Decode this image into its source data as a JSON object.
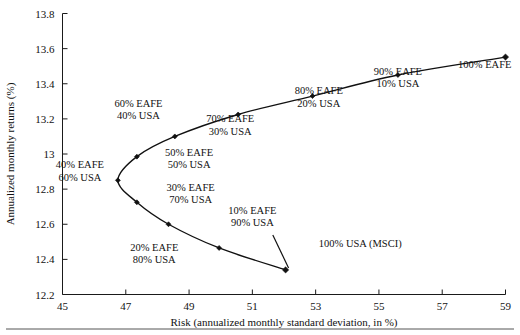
{
  "chart_data": {
    "type": "scatter",
    "title": "",
    "xlabel": "Risk (annualized monthly standard deviation, in %)",
    "ylabel": "Annualized monthly returns (%)",
    "xlim": [
      45,
      59
    ],
    "ylim": [
      12.2,
      13.8
    ],
    "xticks": [
      "45",
      "47",
      "49",
      "51",
      "53",
      "55",
      "57",
      "59"
    ],
    "xtick_values": [
      45,
      47,
      49,
      51,
      53,
      55,
      57,
      59
    ],
    "yticks": [
      "12.2",
      "12.4",
      "12.6",
      "12.8",
      "13",
      "13.2",
      "13.4",
      "13.6",
      "13.8"
    ],
    "ytick_values": [
      12.2,
      12.4,
      12.6,
      12.8,
      13.0,
      13.2,
      13.4,
      13.6,
      13.8
    ],
    "grid": false,
    "legend": "none",
    "series": [
      {
        "name": "Efficient frontier (EAFE / USA allocations)",
        "points": [
          {
            "label_line1": "100% USA (MSCI)",
            "label_line2": "",
            "x": 52.05,
            "y": 12.34,
            "label_x": 53.1,
            "label_y": 12.47,
            "leader": true
          },
          {
            "label_line1": "10% EAFE",
            "label_line2": "90% USA",
            "x": 49.95,
            "y": 12.465,
            "label_x": 51.0,
            "label_y": 12.66,
            "leader": false
          },
          {
            "label_line1": "20% EAFE",
            "label_line2": "80% USA",
            "x": 48.35,
            "y": 12.6,
            "label_x": 47.9,
            "label_y": 12.45,
            "leader": false
          },
          {
            "label_line1": "30% EAFE",
            "label_line2": "70% USA",
            "x": 47.35,
            "y": 12.725,
            "label_x": 49.05,
            "label_y": 12.79,
            "leader": false
          },
          {
            "label_line1": "40% EAFE",
            "label_line2": "60% USA",
            "x": 46.75,
            "y": 12.85,
            "label_x": 45.55,
            "label_y": 12.92,
            "leader": false
          },
          {
            "label_line1": "50% EAFE",
            "label_line2": "50% USA",
            "x": 47.35,
            "y": 12.985,
            "label_x": 49.0,
            "label_y": 12.99,
            "leader": false
          },
          {
            "label_line1": "60% EAFE",
            "label_line2": "40% USA",
            "x": 48.55,
            "y": 13.1,
            "label_x": 47.4,
            "label_y": 13.27,
            "leader": false
          },
          {
            "label_line1": "70% EAFE",
            "label_line2": "30% USA",
            "x": 50.55,
            "y": 13.225,
            "label_x": 50.3,
            "label_y": 13.18,
            "leader": false
          },
          {
            "label_line1": "80% EAFE",
            "label_line2": "20% USA",
            "x": 52.9,
            "y": 13.33,
            "label_x": 53.1,
            "label_y": 13.34,
            "leader": false
          },
          {
            "label_line1": "90% EAFE",
            "label_line2": "10% USA",
            "x": 55.6,
            "y": 13.45,
            "label_x": 55.6,
            "label_y": 13.45,
            "leader": false
          },
          {
            "label_line1": "100% EAFE",
            "label_line2": "",
            "x": 59.0,
            "y": 13.552,
            "label_x": 57.5,
            "label_y": 13.49,
            "leader": false
          }
        ]
      }
    ]
  }
}
